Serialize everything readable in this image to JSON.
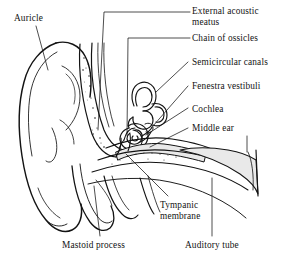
{
  "figure": {
    "background_color": "#ffffff",
    "ink_color": "#131313",
    "shade_color": "#e9e9e9"
  },
  "labels": {
    "external_acoustic_meatus": "External acoustic\nmeatus",
    "chain_of_ossicles": "Chain of ossicles",
    "semicircular_canals": "Semicircular canals",
    "fenestra_vestibuli": "Fenestra vestibuli",
    "cochlea": "Cochlea",
    "middle_ear": "Middle ear",
    "auricle": "Auricle",
    "tympanic_membrane": "Tympanic\nmembrane",
    "mastoid_process": "Mastoid process",
    "auditory_tube": "Auditory tube"
  }
}
